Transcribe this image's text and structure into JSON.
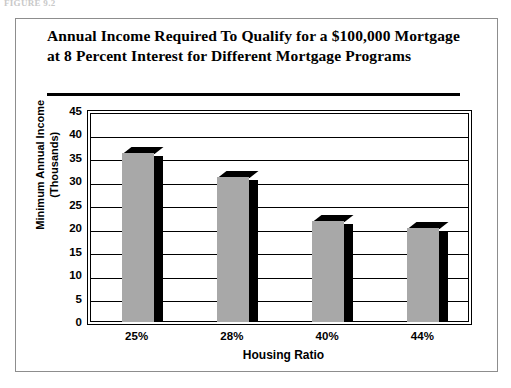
{
  "figure_caption": "FIGURE 9.2",
  "title": "Annual Income Required To Qualify for a $100,000 Mortgage at 8 Percent Interest for Different Mortgage Programs",
  "axis": {
    "y_title_line1": "Minimum Annual Income",
    "y_title_line2": "(Thousands)",
    "x_title": "Housing Ratio"
  },
  "colors": {
    "bar_fill": "#a8a8a8",
    "bar_shadow": "#000000",
    "frame": "#8d8d8d",
    "axis": "#000000"
  },
  "chart_data": {
    "type": "bar",
    "title": "Annual Income Required To Qualify for a $100,000 Mortgage at 8 Percent Interest for Different Mortgage Programs",
    "xlabel": "Housing Ratio",
    "ylabel": "Minimum Annual Income (Thousands)",
    "categories": [
      "25%",
      "28%",
      "40%",
      "44%"
    ],
    "values": [
      36,
      31,
      21.5,
      20
    ],
    "ylim": [
      0,
      45
    ],
    "yticks": [
      0,
      5,
      10,
      15,
      20,
      25,
      30,
      35,
      40,
      45
    ],
    "ytick_labels": [
      "0",
      "5",
      "10",
      "15",
      "20",
      "25",
      "30",
      "35",
      "40",
      "45"
    ],
    "grid": true,
    "legend": "none"
  }
}
